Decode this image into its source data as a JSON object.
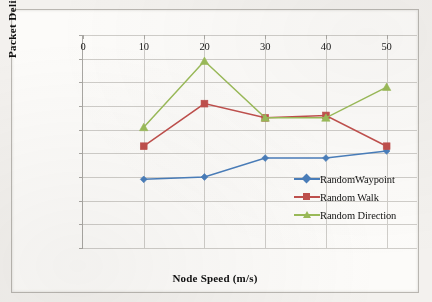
{
  "chart_data": {
    "type": "line",
    "title": "",
    "xlabel": "Node Speed (m/s)",
    "ylabel": "Packet Delivery Ratio",
    "x": [
      10,
      20,
      30,
      40,
      50
    ],
    "xticks": [
      "0",
      "10",
      "20",
      "30",
      "40",
      "50"
    ],
    "xtick_values": [
      0,
      10,
      20,
      30,
      40,
      50
    ],
    "xlim": [
      0,
      55
    ],
    "yticks": [
      "0.83",
      "0.84",
      "0.85",
      "0.86",
      "0.87",
      "0.88",
      "0.89",
      "0.90",
      "0.91",
      "0.92"
    ],
    "ytick_values": [
      0.83,
      0.84,
      0.85,
      0.86,
      0.87,
      0.88,
      0.89,
      0.9,
      0.91,
      0.92
    ],
    "ylim": [
      0.83,
      0.92
    ],
    "grid": "horizontal-and-vertical",
    "legend_position": "inside-lower-right",
    "series": [
      {
        "name": "RandomWaypoint",
        "color": "#4a7ebb",
        "marker": "diamond",
        "values": [
          0.859,
          0.86,
          0.868,
          0.868,
          0.871
        ]
      },
      {
        "name": "Random Walk",
        "color": "#c0504d",
        "marker": "square",
        "values": [
          0.873,
          0.891,
          0.885,
          0.886,
          0.873
        ]
      },
      {
        "name": "Random Direction",
        "color": "#9bbb59",
        "marker": "triangle",
        "values": [
          0.881,
          0.909,
          0.885,
          0.885,
          0.898
        ]
      }
    ]
  }
}
